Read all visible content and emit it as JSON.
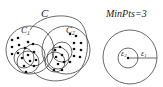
{
  "left_figure": {
    "cluster_label": "C",
    "subcluster_1_label": "C",
    "subcluster_1_sub": "1",
    "subcluster_2_label": "C",
    "subcluster_2_sub": "2"
  },
  "right_figure": {
    "title": "MinPts=3",
    "inner_radius_label": "ε",
    "inner_radius_sub": "2",
    "outer_radius_label": "ε",
    "outer_radius_sub": "1"
  },
  "colors": {
    "stroke": "#333333",
    "dot": "#111111",
    "background": "#ffffff"
  }
}
